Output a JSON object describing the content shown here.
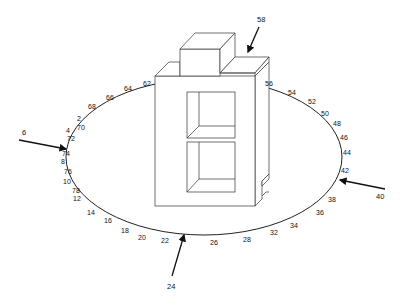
{
  "figure": {
    "reference_numerals": {
      "top_arrow": "58",
      "left_arrow": "6",
      "right_arrow": "40",
      "bottom_arrow": "24"
    },
    "ring_labels": [
      {
        "text": "62",
        "x": 143,
        "y": 86
      },
      {
        "text": "64",
        "x": 124,
        "y": 91
      },
      {
        "text": "66",
        "x": 106,
        "y": 100
      },
      {
        "text": "68",
        "x": 88,
        "y": 109
      },
      {
        "text": "2",
        "x": 77,
        "y": 121
      },
      {
        "text": "70",
        "x": 77,
        "y": 130
      },
      {
        "text": "4",
        "x": 66,
        "y": 133
      },
      {
        "text": "72",
        "x": 67,
        "y": 140
      },
      {
        "text": "74",
        "x": 62,
        "y": 156
      },
      {
        "text": "8",
        "x": 61,
        "y": 164
      },
      {
        "text": "76",
        "x": 64,
        "y": 174
      },
      {
        "text": "10",
        "x": 63,
        "y": 184
      },
      {
        "text": "78",
        "x": 72,
        "y": 193
      },
      {
        "text": "12",
        "x": 73,
        "y": 201
      },
      {
        "text": "14",
        "x": 87,
        "y": 215
      },
      {
        "text": "16",
        "x": 104,
        "y": 223
      },
      {
        "text": "18",
        "x": 121,
        "y": 233
      },
      {
        "text": "20",
        "x": 138,
        "y": 240
      },
      {
        "text": "22",
        "x": 161,
        "y": 243
      },
      {
        "text": "26",
        "x": 210,
        "y": 245
      },
      {
        "text": "28",
        "x": 243,
        "y": 242
      },
      {
        "text": "32",
        "x": 270,
        "y": 235
      },
      {
        "text": "34",
        "x": 290,
        "y": 228
      },
      {
        "text": "36",
        "x": 316,
        "y": 215
      },
      {
        "text": "38",
        "x": 328,
        "y": 202
      },
      {
        "text": "42",
        "x": 341,
        "y": 173
      },
      {
        "text": "44",
        "x": 343,
        "y": 155
      },
      {
        "text": "46",
        "x": 340,
        "y": 140
      },
      {
        "text": "48",
        "x": 333,
        "y": 126
      },
      {
        "text": "50",
        "x": 321,
        "y": 116
      },
      {
        "text": "52",
        "x": 308,
        "y": 104
      },
      {
        "text": "54",
        "x": 288,
        "y": 95
      },
      {
        "text": "56",
        "x": 265,
        "y": 86
      }
    ]
  }
}
